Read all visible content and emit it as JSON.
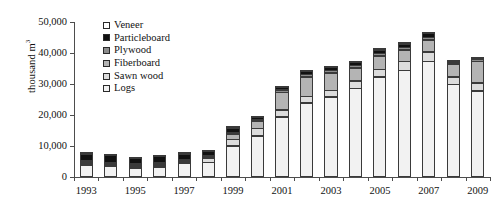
{
  "chart_data": {
    "type": "bar",
    "stacked": true,
    "title": "",
    "xlabel": "",
    "ylabel": "thousand m³",
    "ylim": [
      0,
      50000
    ],
    "ytick_values": [
      0,
      10000,
      20000,
      30000,
      40000,
      50000
    ],
    "ytick_labels": [
      "0",
      "10,000",
      "20,000",
      "30,000",
      "40,000",
      "50,000"
    ],
    "grid": false,
    "legend_position": "inside-top-left",
    "categories": [
      "1993",
      "1994",
      "1995",
      "1996",
      "1997",
      "1998",
      "1999",
      "2000",
      "2001",
      "2002",
      "2003",
      "2004",
      "2005",
      "2006",
      "2007",
      "2008",
      "2009"
    ],
    "xtick_labels_shown": [
      "1993",
      "1995",
      "1997",
      "1999",
      "2001",
      "2003",
      "2005",
      "2007",
      "2009"
    ],
    "series": [
      {
        "name": "Logs",
        "color": "#f2f2f2",
        "values": [
          3900,
          3500,
          2900,
          3300,
          4400,
          4700,
          10100,
          13300,
          19500,
          24000,
          25900,
          28700,
          32300,
          34500,
          37300,
          30000,
          27800
        ]
      },
      {
        "name": "Sawn wood",
        "color": "#dcdcdc",
        "values": [
          400,
          300,
          300,
          300,
          500,
          1500,
          2300,
          2600,
          2400,
          2200,
          2300,
          2500,
          2700,
          3000,
          3300,
          2600,
          2800
        ]
      },
      {
        "name": "Fiberboard",
        "color": "#b4b4b4",
        "values": [
          100,
          100,
          100,
          100,
          200,
          300,
          1900,
          2700,
          5900,
          6500,
          5800,
          4500,
          4500,
          4000,
          4100,
          4200,
          7200
        ]
      },
      {
        "name": "Plywood",
        "color": "#8c8c8c",
        "values": [
          100,
          100,
          100,
          100,
          200,
          300,
          400,
          500,
          900,
          1100,
          1100,
          1000,
          1000,
          900,
          900,
          700,
          700
        ]
      },
      {
        "name": "Particleboard",
        "color": "#111111",
        "values": [
          2400,
          2300,
          2000,
          2300,
          2000,
          1700,
          1700,
          900,
          1000,
          1100,
          1100,
          1100,
          1300,
          1400,
          1500,
          500,
          400
        ]
      },
      {
        "name": "Veneer",
        "color": "#ffffff",
        "values": [
          100,
          100,
          100,
          100,
          100,
          100,
          100,
          100,
          100,
          100,
          100,
          100,
          100,
          100,
          100,
          100,
          100
        ]
      }
    ],
    "totals": [
      7000,
      6400,
      5500,
      6200,
      7400,
      8600,
      16500,
      20100,
      29800,
      35000,
      36300,
      37900,
      41900,
      43900,
      47200,
      38100,
      39000
    ]
  },
  "legend": {
    "items": [
      {
        "label": "Veneer",
        "icon": "legend-swatch-veneer"
      },
      {
        "label": "Particleboard",
        "icon": "legend-swatch-particleboard"
      },
      {
        "label": "Plywood",
        "icon": "legend-swatch-plywood"
      },
      {
        "label": "Fiberboard",
        "icon": "legend-swatch-fiberboard"
      },
      {
        "label": "Sawn wood",
        "icon": "legend-swatch-sawn-wood"
      },
      {
        "label": "Logs",
        "icon": "legend-swatch-logs"
      }
    ]
  }
}
